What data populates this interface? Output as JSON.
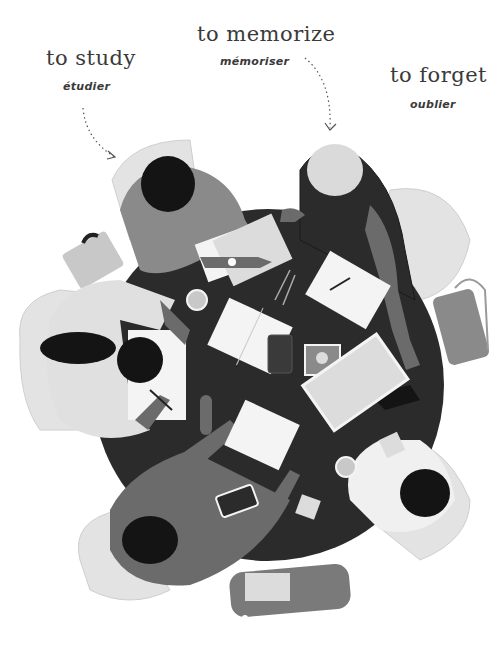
{
  "labels": [
    {
      "en": "to study",
      "fr": "étudier"
    },
    {
      "en": "to memorize",
      "fr": "mémoriser"
    },
    {
      "en": "to forget",
      "fr": "oublier"
    }
  ],
  "colors": {
    "table": "#2b2b2b",
    "chair": "#e3e3e3",
    "paper": "#f4f4f4",
    "mid_gray": "#8a8a8a",
    "dark_gray": "#4a4a4a",
    "skin_dark": "#6b6b6b",
    "hair": "#141414",
    "text": "#3a3a3a"
  }
}
